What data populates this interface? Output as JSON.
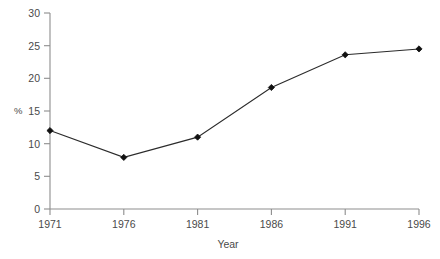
{
  "chart_data": {
    "type": "line",
    "title": "",
    "xlabel": "Year",
    "ylabel": "%",
    "x": [
      1971,
      1976,
      1981,
      1986,
      1991,
      1996
    ],
    "categories": [
      "1971",
      "1976",
      "1981",
      "1986",
      "1991",
      "1996"
    ],
    "values": [
      12.0,
      7.9,
      11.0,
      18.6,
      23.6,
      24.5
    ],
    "series": [
      {
        "name": "",
        "values": [
          12.0,
          7.9,
          11.0,
          18.6,
          23.6,
          24.5
        ]
      }
    ],
    "xlim": [
      1971,
      1996
    ],
    "ylim": [
      0,
      30
    ],
    "yticks": [
      0,
      5,
      10,
      15,
      20,
      25,
      30
    ],
    "ytick_labels": [
      "0",
      "5",
      "10",
      "15",
      "20",
      "25",
      "30"
    ],
    "xticks": [
      1971,
      1976,
      1981,
      1986,
      1991,
      1996
    ],
    "xtick_labels": [
      "1971",
      "1976",
      "1981",
      "1986",
      "1991",
      "1996"
    ],
    "grid": false,
    "legend": null,
    "marker": "diamond",
    "line_color": "#2b2b2b",
    "marker_color": "#111111",
    "axis_color": "#8d8d8d",
    "background_color": "#ffffff"
  },
  "axes": {
    "y_axis_label": "%",
    "x_axis_label": "Year",
    "y_tick_0": "0",
    "y_tick_5": "5",
    "y_tick_10": "10",
    "y_tick_15": "15",
    "y_tick_20": "20",
    "y_tick_25": "25",
    "y_tick_30": "30",
    "x_tick_1971": "1971",
    "x_tick_1976": "1976",
    "x_tick_1981": "1981",
    "x_tick_1986": "1986",
    "x_tick_1991": "1991",
    "x_tick_1996": "1996"
  },
  "header": {
    "cropped_caption": ""
  }
}
